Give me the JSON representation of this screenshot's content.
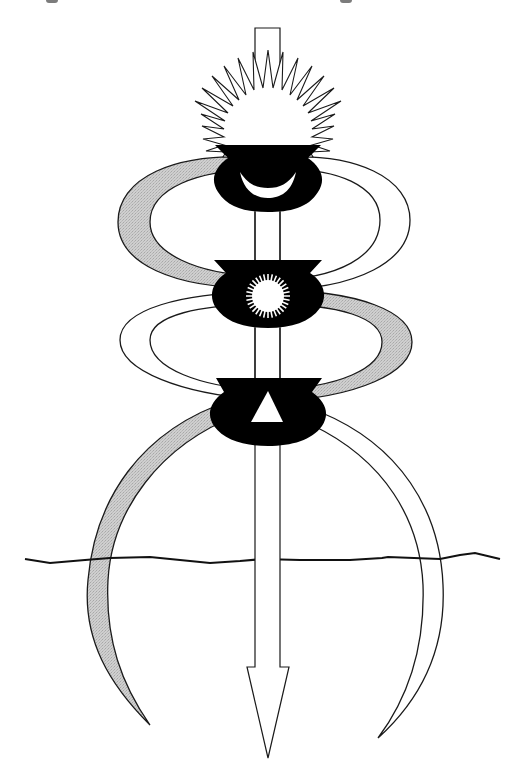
{
  "figure": {
    "type": "symbolic-diagram",
    "colors": {
      "background": "#ffffff",
      "ink": "#1a1a1a",
      "band_grey": "#c8c8c8",
      "band_white": "#ffffff",
      "vessel": "#000000",
      "symbol_fill": "#ffffff"
    },
    "elements": {
      "axis_arrow": {
        "direction": "down",
        "fill": "#ffffff"
      },
      "top_sun": {
        "rays": 30,
        "fill": "#ffffff"
      },
      "vessels": [
        {
          "position": "upper",
          "symbol": "crescent-moon"
        },
        {
          "position": "middle",
          "symbol": "sun"
        },
        {
          "position": "lower",
          "symbol": "triangle"
        }
      ],
      "bands": [
        {
          "name": "grey-band",
          "fill": "#c8c8c8"
        },
        {
          "name": "white-band",
          "fill": "#ffffff"
        }
      ],
      "horizon_line": {
        "style": "wavy"
      }
    }
  }
}
